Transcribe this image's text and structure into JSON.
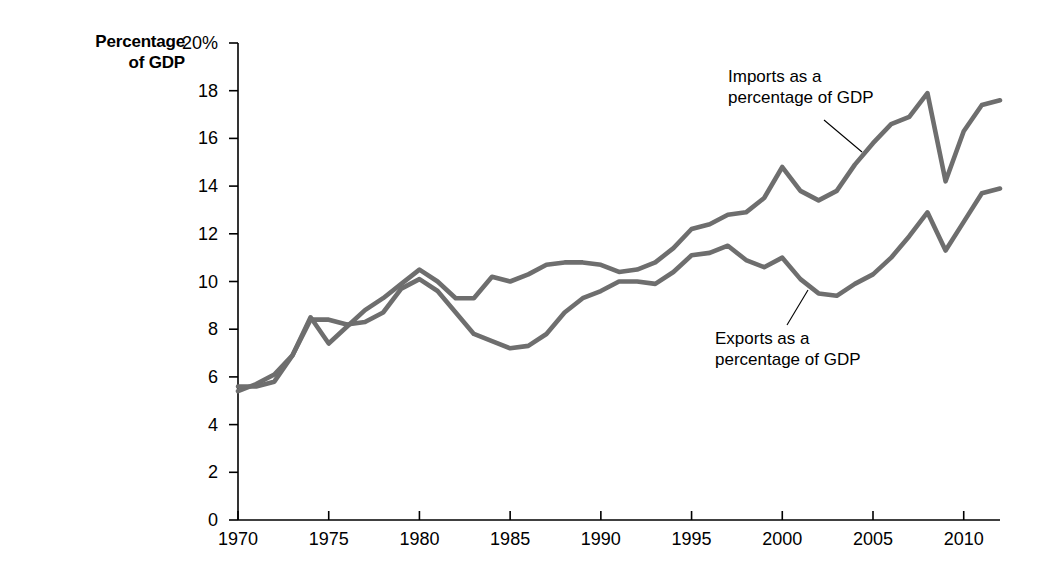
{
  "chart_data": {
    "type": "line",
    "title": "",
    "xlabel": "",
    "ylabel": "Percentage of GDP",
    "ylim": [
      0,
      20
    ],
    "xlim": [
      1970,
      2012
    ],
    "grid": false,
    "legend_position": "inline-annotations",
    "y_tick_labels": [
      "20%",
      "18",
      "16",
      "14",
      "12",
      "10",
      "8",
      "6",
      "4",
      "2",
      "0"
    ],
    "y_ticks": [
      20,
      18,
      16,
      14,
      12,
      10,
      8,
      6,
      4,
      2,
      0
    ],
    "x_tick_labels": [
      "1970",
      "1975",
      "1980",
      "1985",
      "1990",
      "1995",
      "2000",
      "2005",
      "2010"
    ],
    "x_ticks": [
      1970,
      1975,
      1980,
      1985,
      1990,
      1995,
      2000,
      2005,
      2010
    ],
    "x": [
      1970,
      1971,
      1972,
      1973,
      1974,
      1975,
      1976,
      1977,
      1978,
      1979,
      1980,
      1981,
      1982,
      1983,
      1984,
      1985,
      1986,
      1987,
      1988,
      1989,
      1990,
      1991,
      1992,
      1993,
      1994,
      1995,
      1996,
      1997,
      1998,
      1999,
      2000,
      2001,
      2002,
      2003,
      2004,
      2005,
      2006,
      2007,
      2008,
      2009,
      2010,
      2011,
      2012
    ],
    "series": [
      {
        "name": "Imports as a percentage of GDP",
        "color": "#6e6e6e",
        "values": [
          5.4,
          5.7,
          6.1,
          6.9,
          8.5,
          7.4,
          8.1,
          8.8,
          9.3,
          9.9,
          10.5,
          10.0,
          9.3,
          9.3,
          10.2,
          10.0,
          10.3,
          10.7,
          10.8,
          10.8,
          10.7,
          10.4,
          10.5,
          10.8,
          11.4,
          12.2,
          12.4,
          12.8,
          12.9,
          13.5,
          14.8,
          13.8,
          13.4,
          13.8,
          14.9,
          15.8,
          16.6,
          16.9,
          17.9,
          14.2,
          16.3,
          17.4,
          17.6
        ]
      },
      {
        "name": "Exports as a percentage of GDP",
        "color": "#6e6e6e",
        "values": [
          5.6,
          5.6,
          5.8,
          6.9,
          8.4,
          8.4,
          8.2,
          8.3,
          8.7,
          9.7,
          10.1,
          9.6,
          8.7,
          7.8,
          7.5,
          7.2,
          7.3,
          7.8,
          8.7,
          9.3,
          9.6,
          10.0,
          10.0,
          9.9,
          10.4,
          11.1,
          11.2,
          11.5,
          10.9,
          10.6,
          11.0,
          10.1,
          9.5,
          9.4,
          9.9,
          10.3,
          11.0,
          11.9,
          12.9,
          11.3,
          12.5,
          13.7,
          13.9
        ]
      }
    ]
  },
  "axis": {
    "y_title": "Percentage\nof GDP"
  },
  "annotations": [
    {
      "name": "imports-annotation",
      "text": "Imports as a\npercentage of GDP"
    },
    {
      "name": "exports-annotation",
      "text": "Exports as a\npercentage of GDP"
    }
  ]
}
